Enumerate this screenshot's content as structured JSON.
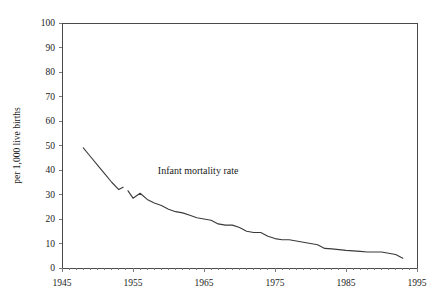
{
  "chart_data": {
    "type": "line",
    "title": "",
    "xlabel": "",
    "ylabel": "per 1,000 live births",
    "annotation": "Infant mortality rate",
    "grid": false,
    "legend_position": "none",
    "line_color": "#3a3a3a",
    "axis_color": "#4a4a4a",
    "xlim": [
      1945,
      1995
    ],
    "ylim": [
      0,
      100
    ],
    "xticks": [
      1945,
      1955,
      1965,
      1975,
      1985,
      1995
    ],
    "yticks": [
      0,
      10,
      20,
      30,
      40,
      50,
      60,
      70,
      80,
      90,
      100
    ],
    "xtick_labels": [
      "1945",
      "1955",
      "1965",
      "1975",
      "1985",
      "1995"
    ],
    "ytick_labels": [
      "0",
      "10",
      "20",
      "30",
      "40",
      "50",
      "60",
      "70",
      "80",
      "90",
      "100"
    ],
    "x_minor_tick_interval": 1,
    "series": [
      {
        "name": "Infant mortality rate",
        "segments": [
          {
            "label": "1948-1953",
            "x": [
              1948,
              1949,
              1950,
              1951,
              1952,
              1953,
              1953.6
            ],
            "y": [
              49.0,
              45.5,
              42.0,
              38.5,
              35.0,
              32.0,
              33.0
            ]
          },
          {
            "label": "1954-1993",
            "x": [
              1954.3,
              1955,
              1956,
              1957,
              1958,
              1959,
              1960,
              1961,
              1962,
              1963,
              1964,
              1965,
              1966,
              1967,
              1968,
              1969,
              1970,
              1971,
              1972,
              1973,
              1974,
              1975,
              1976,
              1977,
              1978,
              1979,
              1980,
              1981,
              1982,
              1983,
              1984,
              1985,
              1986,
              1987,
              1988,
              1989,
              1990,
              1991,
              1992,
              1993
            ],
            "y": [
              31.5,
              28.5,
              30.5,
              28.0,
              26.5,
              25.5,
              24.0,
              23.0,
              22.5,
              21.5,
              20.5,
              20.0,
              19.5,
              18.0,
              17.5,
              17.5,
              16.5,
              15.0,
              14.5,
              14.5,
              13.0,
              12.0,
              11.5,
              11.5,
              11.0,
              10.5,
              10.0,
              9.5,
              8.0,
              7.8,
              7.5,
              7.2,
              7.0,
              6.8,
              6.5,
              6.5,
              6.5,
              6.0,
              5.5,
              4.0
            ]
          }
        ]
      }
    ],
    "plot_area": {
      "left": 62,
      "top": 23,
      "right": 417,
      "bottom": 268
    }
  }
}
